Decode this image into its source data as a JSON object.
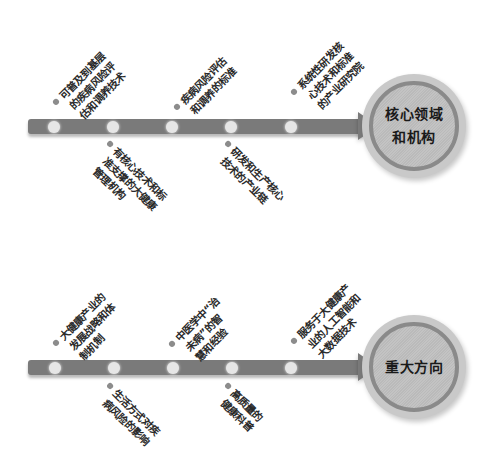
{
  "diagram": {
    "title": "",
    "colors": {
      "bar": "#7a7a7a",
      "node_dot": "#e6e6e6",
      "hub_fill": "#c3c3c3",
      "hub_ring": "#8a8a8a",
      "bullet": "#8c8c8c",
      "text": "#2a2a2a"
    },
    "sections": [
      {
        "hub_label_lines": [
          "核心领域",
          "和机构"
        ],
        "upper_items": [
          {
            "lines": [
              "可普及到基层",
              "的疾病风险评",
              "估和调养技术"
            ]
          },
          {
            "lines": [
              "疾病风险评估",
              "和调养的标准"
            ]
          },
          {
            "lines": [
              "系统性研发核",
              "心技术和标准",
              "的产业研究院"
            ]
          }
        ],
        "lower_items": [
          {
            "lines": [
              "有核心技术和标",
              "准支撑的大健康",
              "管理机构"
            ]
          },
          {
            "lines": [
              "研发和生产核心",
              "技术的产业链"
            ]
          }
        ]
      },
      {
        "hub_label_lines": [
          "重大方向"
        ],
        "upper_items": [
          {
            "lines": [
              "大健康产业的",
              "发展战略和体",
              "制机制"
            ]
          },
          {
            "lines": [
              "中医学中“治",
              "未病”的智",
              "慧和经验"
            ]
          },
          {
            "lines": [
              "服务于大健康产",
              "业的人工智能和",
              "大数据技术"
            ]
          }
        ],
        "lower_items": [
          {
            "lines": [
              "生活方式对疾",
              "病风险的影响"
            ]
          },
          {
            "lines": [
              "高质量的",
              "健康科普"
            ]
          }
        ]
      }
    ]
  }
}
